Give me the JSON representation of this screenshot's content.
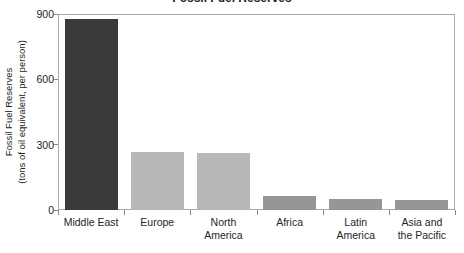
{
  "chart_data": {
    "type": "bar",
    "title": "Fossil Fuel Reserves",
    "title_note": "partially cropped at top edge of screenshot",
    "categories": [
      "Middle East",
      "Europe",
      "North America",
      "Africa",
      "Latin America",
      "Asia and the Pacific"
    ],
    "category_lines": [
      [
        "Middle East"
      ],
      [
        "Europe"
      ],
      [
        "North",
        "America"
      ],
      [
        "Africa"
      ],
      [
        "Latin",
        "America"
      ],
      [
        "Asia and",
        "the Pacific"
      ]
    ],
    "values": [
      877,
      266,
      264,
      64,
      50,
      48
    ],
    "bar_colors": [
      "#3a3a3a",
      "#b8b8b8",
      "#b8b8b8",
      "#969696",
      "#969696",
      "#969696"
    ],
    "xlabel": "",
    "ylabel": "Fossil Fuel Reserves (tons of oil equivalent, per person)",
    "ylabel_line1": "Fossil Fuel Reserves",
    "ylabel_line2": "(tons of oil equivalent, per person)",
    "ylim": [
      0,
      900
    ],
    "yticks": [
      0,
      300,
      600,
      900
    ],
    "ytick_labels": [
      "0",
      "300",
      "600",
      "900"
    ],
    "grid": false,
    "legend": false,
    "legend_position": "none",
    "axis_color": "#a9a9a9",
    "text_color": "#231f20",
    "background": "#ffffff"
  }
}
